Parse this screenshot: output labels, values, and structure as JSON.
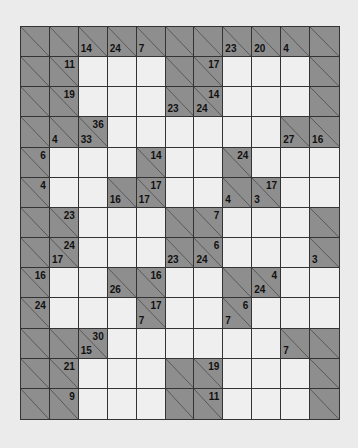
{
  "puzzle": {
    "type": "kakuro",
    "cols": 11,
    "rows": 13,
    "colors": {
      "blank": "#efefef",
      "clue": "#8e8e8e",
      "line": "#333333",
      "background": "#ebebeb"
    },
    "grid": [
      [
        [
          "B"
        ],
        [
          "B"
        ],
        [
          "B",
          null,
          14
        ],
        [
          "B",
          null,
          24
        ],
        [
          "B",
          null,
          7
        ],
        [
          "B"
        ],
        [
          "B"
        ],
        [
          "B",
          null,
          23
        ],
        [
          "B",
          null,
          20
        ],
        [
          "B",
          null,
          4
        ],
        [
          "B"
        ]
      ],
      [
        [
          "B"
        ],
        [
          "B",
          11,
          null
        ],
        [
          "W"
        ],
        [
          "W"
        ],
        [
          "W"
        ],
        [
          "B"
        ],
        [
          "B",
          17,
          null
        ],
        [
          "W"
        ],
        [
          "W"
        ],
        [
          "W"
        ],
        [
          "B"
        ]
      ],
      [
        [
          "B"
        ],
        [
          "B",
          19,
          null
        ],
        [
          "W"
        ],
        [
          "W"
        ],
        [
          "W"
        ],
        [
          "B",
          null,
          23
        ],
        [
          "B",
          14,
          24
        ],
        [
          "W"
        ],
        [
          "W"
        ],
        [
          "W"
        ],
        [
          "B"
        ]
      ],
      [
        [
          "B"
        ],
        [
          "B",
          null,
          4
        ],
        [
          "B",
          36,
          33
        ],
        [
          "W"
        ],
        [
          "W"
        ],
        [
          "W"
        ],
        [
          "W"
        ],
        [
          "W"
        ],
        [
          "W"
        ],
        [
          "B",
          null,
          27
        ],
        [
          "B",
          null,
          16
        ]
      ],
      [
        [
          "B",
          6,
          null
        ],
        [
          "W"
        ],
        [
          "W"
        ],
        [
          "W"
        ],
        [
          "B",
          14,
          null
        ],
        [
          "W"
        ],
        [
          "W"
        ],
        [
          "B",
          24,
          null
        ],
        [
          "W"
        ],
        [
          "W"
        ],
        [
          "W"
        ]
      ],
      [
        [
          "B",
          4,
          null
        ],
        [
          "W"
        ],
        [
          "W"
        ],
        [
          "B",
          null,
          16
        ],
        [
          "B",
          17,
          17
        ],
        [
          "W"
        ],
        [
          "W"
        ],
        [
          "B",
          null,
          4
        ],
        [
          "B",
          17,
          3
        ],
        [
          "W"
        ],
        [
          "W"
        ]
      ],
      [
        [
          "B"
        ],
        [
          "B",
          23,
          null
        ],
        [
          "W"
        ],
        [
          "W"
        ],
        [
          "W"
        ],
        [
          "B"
        ],
        [
          "B",
          7,
          null
        ],
        [
          "W"
        ],
        [
          "W"
        ],
        [
          "W"
        ],
        [
          "B"
        ]
      ],
      [
        [
          "B"
        ],
        [
          "B",
          24,
          17
        ],
        [
          "W"
        ],
        [
          "W"
        ],
        [
          "W"
        ],
        [
          "B",
          null,
          23
        ],
        [
          "B",
          6,
          24
        ],
        [
          "W"
        ],
        [
          "W"
        ],
        [
          "W"
        ],
        [
          "B",
          null,
          3
        ]
      ],
      [
        [
          "B",
          16,
          null
        ],
        [
          "W"
        ],
        [
          "W"
        ],
        [
          "B",
          null,
          26
        ],
        [
          "B",
          16,
          null
        ],
        [
          "W"
        ],
        [
          "W"
        ],
        [
          "B"
        ],
        [
          "B",
          4,
          24
        ],
        [
          "W"
        ],
        [
          "W"
        ]
      ],
      [
        [
          "B",
          24,
          null
        ],
        [
          "W"
        ],
        [
          "W"
        ],
        [
          "W"
        ],
        [
          "B",
          17,
          7
        ],
        [
          "W"
        ],
        [
          "W"
        ],
        [
          "B",
          6,
          7
        ],
        [
          "W"
        ],
        [
          "W"
        ],
        [
          "W"
        ]
      ],
      [
        [
          "B"
        ],
        [
          "B"
        ],
        [
          "B",
          30,
          15
        ],
        [
          "W"
        ],
        [
          "W"
        ],
        [
          "W"
        ],
        [
          "W"
        ],
        [
          "W"
        ],
        [
          "W"
        ],
        [
          "B",
          null,
          7
        ],
        [
          "B"
        ]
      ],
      [
        [
          "B"
        ],
        [
          "B",
          21,
          null
        ],
        [
          "W"
        ],
        [
          "W"
        ],
        [
          "W"
        ],
        [
          "B"
        ],
        [
          "B",
          19,
          null
        ],
        [
          "W"
        ],
        [
          "W"
        ],
        [
          "W"
        ],
        [
          "B"
        ]
      ],
      [
        [
          "B"
        ],
        [
          "B",
          9,
          null
        ],
        [
          "W"
        ],
        [
          "W"
        ],
        [
          "W"
        ],
        [
          "B"
        ],
        [
          "B",
          11,
          null
        ],
        [
          "W"
        ],
        [
          "W"
        ],
        [
          "W"
        ],
        [
          "B"
        ]
      ]
    ]
  }
}
